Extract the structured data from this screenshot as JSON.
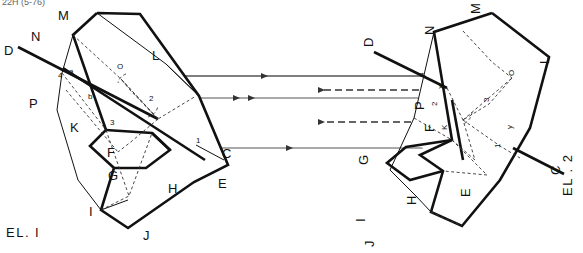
{
  "page": {
    "width": 583,
    "height": 253,
    "background": "#ffffff",
    "header_text": "22H (5-76)"
  },
  "figure": {
    "type": "technical-line-drawing",
    "colors": {
      "ink": "#111111",
      "ray": "#555555",
      "construction": "#333333",
      "paper": "#ffffff"
    }
  },
  "elements": [
    {
      "id": "el1",
      "caption": "EL. I",
      "caption_rotation": 0,
      "vertex_labels": [
        "M",
        "N",
        "L",
        "O",
        "P",
        "K",
        "F",
        "G",
        "H",
        "I",
        "J",
        "E"
      ],
      "ray_labels": [
        "D",
        "C"
      ],
      "angle_numbers": [
        "1",
        "2",
        "3",
        "4"
      ],
      "point_markers": [
        "a",
        "b"
      ]
    },
    {
      "id": "el2",
      "caption": "EL . 2",
      "caption_rotation": -90,
      "vertex_labels": [
        "M",
        "N",
        "L",
        "O",
        "P",
        "K",
        "F",
        "G",
        "H",
        "I",
        "J",
        "E"
      ],
      "ray_labels": [
        "D",
        "C"
      ],
      "angle_numbers": [
        "1",
        "2",
        "3",
        "4"
      ],
      "point_markers": [
        "x",
        "y"
      ]
    }
  ],
  "rays": {
    "solid_direction": "right",
    "dashed_direction": "left",
    "solid_count": 3,
    "dashed_count": 2,
    "solid_y": [
      76,
      98,
      148
    ],
    "dashed_y": [
      90,
      122
    ]
  },
  "labels": {
    "el1_caption": "EL. I",
    "el2_caption": "EL . 2",
    "M": "M",
    "N": "N",
    "L": "L",
    "O": "O",
    "P": "P",
    "K": "K",
    "F": "F",
    "G": "G",
    "H": "H",
    "I": "I",
    "J": "J",
    "E": "E",
    "C": "C",
    "D": "D",
    "n1": "1",
    "n2": "2",
    "n3": "3",
    "n4": "4",
    "a": "a",
    "b": "b",
    "x": "x",
    "y": "y"
  }
}
